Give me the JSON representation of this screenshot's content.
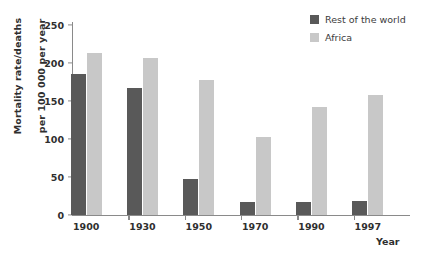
{
  "chart_data": {
    "type": "bar",
    "title": "",
    "xlabel": "Year",
    "ylabel": "Mortality rate/deaths per 100 000 per year",
    "ylabel_lines": [
      "Mortality rate/deaths",
      "per 100 000 per year"
    ],
    "categories": [
      "1900",
      "1930",
      "1950",
      "1970",
      "1990",
      "1997"
    ],
    "series": [
      {
        "name": "Rest of the world",
        "color": "#595959",
        "values": [
          185,
          167,
          47,
          17,
          17,
          18
        ]
      },
      {
        "name": "Africa",
        "color": "#c8c8c8",
        "values": [
          213,
          207,
          177,
          103,
          142,
          158
        ]
      }
    ],
    "ylim": [
      0,
      250
    ],
    "yticks": [
      0,
      50,
      100,
      150,
      200,
      250
    ],
    "ytick_labels": [
      "0",
      "50",
      "100",
      "150",
      "200",
      "250"
    ],
    "grid": false,
    "legend_position": "top-right"
  },
  "legend": {
    "items": [
      {
        "label": "Rest of the world",
        "color": "#595959"
      },
      {
        "label": "Africa",
        "color": "#c8c8c8"
      }
    ]
  },
  "axis": {
    "x_title": "Year",
    "y_title_line1": "Mortality rate/deaths",
    "y_title_line2": "per 100 000 per year"
  }
}
